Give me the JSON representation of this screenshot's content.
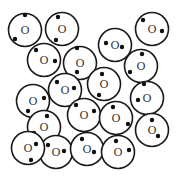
{
  "diagram": {
    "particle_label": "O",
    "radius": 16.5,
    "colors": {
      "stroke": "#1a1a1a",
      "dot": "#111111",
      "label": "#333333",
      "background": "#ffffff"
    },
    "particles": [
      {
        "cx": 25,
        "cy": 30,
        "dots": [
          [
            25,
            15
          ],
          [
            15,
            39
          ]
        ]
      },
      {
        "cx": 62,
        "cy": 29,
        "dots": [
          [
            58,
            17
          ],
          [
            56,
            40
          ]
        ]
      },
      {
        "cx": 115,
        "cy": 45,
        "dots": [
          [
            106,
            43
          ],
          [
            122,
            47
          ]
        ]
      },
      {
        "cx": 152,
        "cy": 29,
        "dots": [
          [
            143,
            20
          ],
          [
            162,
            31
          ]
        ]
      },
      {
        "cx": 44,
        "cy": 60,
        "dots": [
          [
            36,
            50
          ],
          [
            55,
            61
          ]
        ]
      },
      {
        "cx": 80,
        "cy": 63,
        "dots": [
          [
            77,
            48
          ],
          [
            77,
            72
          ]
        ]
      },
      {
        "cx": 141,
        "cy": 66,
        "dots": [
          [
            142,
            54
          ],
          [
            130,
            72
          ]
        ]
      },
      {
        "cx": 33,
        "cy": 101,
        "dots": [
          [
            44,
            98
          ],
          [
            28,
            111
          ]
        ]
      },
      {
        "cx": 65,
        "cy": 90,
        "dots": [
          [
            57,
            82
          ],
          [
            74,
            88
          ]
        ]
      },
      {
        "cx": 104,
        "cy": 84,
        "dots": [
          [
            102,
            74
          ],
          [
            99,
            95
          ]
        ]
      },
      {
        "cx": 147,
        "cy": 98,
        "dots": [
          [
            144,
            84
          ],
          [
            138,
            100
          ]
        ]
      },
      {
        "cx": 84,
        "cy": 115,
        "dots": [
          [
            76,
            105
          ],
          [
            94,
            111
          ]
        ]
      },
      {
        "cx": 116,
        "cy": 118,
        "dots": [
          [
            113,
            107
          ],
          [
            128,
            124
          ]
        ]
      },
      {
        "cx": 152,
        "cy": 130,
        "dots": [
          [
            152,
            120
          ],
          [
            158,
            136
          ]
        ]
      },
      {
        "cx": 44,
        "cy": 127,
        "dots": [
          [
            47,
            116
          ],
          [
            34,
            133
          ]
        ]
      },
      {
        "cx": 56,
        "cy": 152,
        "dots": [
          [
            48,
            145
          ],
          [
            64,
            151
          ]
        ]
      },
      {
        "cx": 87,
        "cy": 149,
        "dots": [
          [
            82,
            139
          ],
          [
            94,
            152
          ]
        ]
      },
      {
        "cx": 118,
        "cy": 152,
        "dots": [
          [
            116,
            141
          ],
          [
            129,
            150
          ]
        ]
      },
      {
        "cx": 28,
        "cy": 148,
        "dots": [
          [
            36,
            144
          ],
          [
            31,
            160
          ]
        ]
      }
    ]
  }
}
